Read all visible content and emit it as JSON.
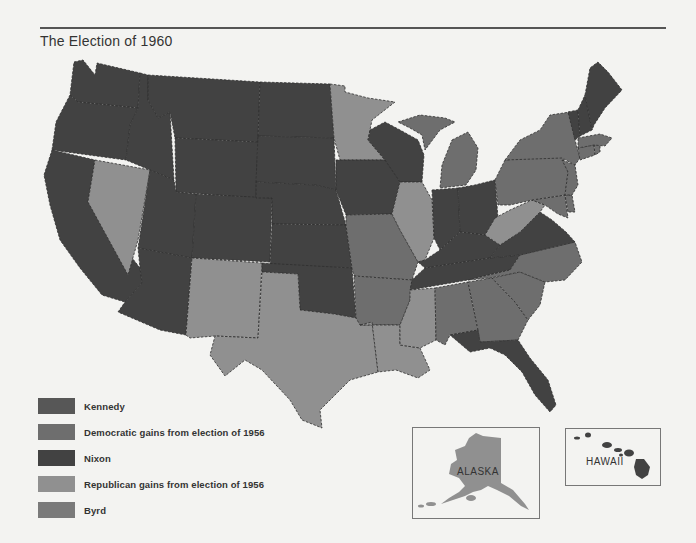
{
  "title": "The Election of 1960",
  "colors": {
    "kennedy": "#575757",
    "democratic_gains": "#6e6e6e",
    "nixon": "#424242",
    "republican_gains": "#909090",
    "byrd": "#7a7a7a",
    "background": "#f3f3f1",
    "border": "#2f2f2f"
  },
  "legend": {
    "items": [
      {
        "key": "kennedy",
        "label": "Kennedy"
      },
      {
        "key": "democratic_gains",
        "label": "Democratic gains from election of 1956"
      },
      {
        "key": "nixon",
        "label": "Nixon"
      },
      {
        "key": "republican_gains",
        "label": "Republican gains from election of 1956"
      },
      {
        "key": "byrd",
        "label": "Byrd"
      }
    ]
  },
  "insets": {
    "alaska": {
      "label": "ALASKA",
      "category": "republican_gains"
    },
    "hawaii": {
      "label": "HAWAII",
      "category": "nixon"
    }
  },
  "states": {
    "WA": "nixon",
    "OR": "nixon",
    "CA": "nixon",
    "ID": "nixon",
    "NV": "republican_gains",
    "MT": "nixon",
    "WY": "nixon",
    "UT": "nixon",
    "AZ": "nixon",
    "CO": "nixon",
    "NM": "republican_gains",
    "ND": "nixon",
    "SD": "nixon",
    "NE": "nixon",
    "KS": "nixon",
    "OK": "nixon",
    "TX": "republican_gains",
    "MN": "republican_gains",
    "IA": "nixon",
    "MO": "democratic_gains",
    "AR": "democratic_gains",
    "LA": "republican_gains",
    "WI": "nixon",
    "IL": "republican_gains",
    "MI": "democratic_gains",
    "IN": "nixon",
    "OH": "nixon",
    "KY": "nixon",
    "TN": "nixon",
    "MS": "republican_gains",
    "AL": "democratic_gains",
    "GA": "democratic_gains",
    "FL": "nixon",
    "SC": "democratic_gains",
    "NC": "democratic_gains",
    "VA": "nixon",
    "WV": "republican_gains",
    "MD": "democratic_gains",
    "DE": "democratic_gains",
    "NJ": "democratic_gains",
    "PA": "democratic_gains",
    "NY": "democratic_gains",
    "CT": "democratic_gains",
    "RI": "democratic_gains",
    "MA": "democratic_gains",
    "VT": "nixon",
    "NH": "nixon",
    "ME": "nixon"
  }
}
